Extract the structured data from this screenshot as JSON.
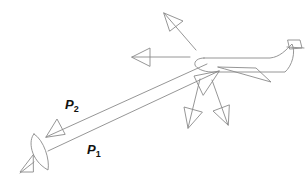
{
  "diagram": {
    "type": "radar-scattering",
    "elements": {
      "radar_dish": "radar-antenna",
      "aircraft": "airplane-target",
      "scatter_arrows": [
        "up-left",
        "left",
        "down-left",
        "down",
        "down-right"
      ]
    },
    "labels": {
      "p2": {
        "main": "P",
        "sub": "2"
      },
      "p1": {
        "main": "P",
        "sub": "1"
      }
    },
    "colors": {
      "line": "#8a8a8a",
      "text": "#111111",
      "background": "#ffffff"
    }
  }
}
